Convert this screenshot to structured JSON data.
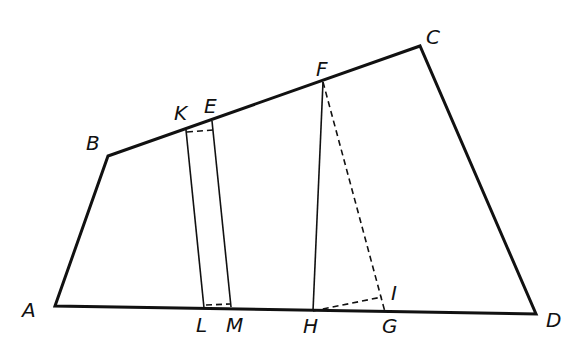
{
  "figure": {
    "colors": {
      "stroke": "#111111",
      "background": "#ffffff"
    },
    "points": {
      "A": {
        "x": 55,
        "y": 306
      },
      "B": {
        "x": 108,
        "y": 156
      },
      "C": {
        "x": 420,
        "y": 46
      },
      "D": {
        "x": 536,
        "y": 314
      },
      "K": {
        "x": 186,
        "y": 130
      },
      "E": {
        "x": 212,
        "y": 121
      },
      "L": {
        "x": 204,
        "y": 308
      },
      "M": {
        "x": 231,
        "y": 307
      },
      "F": {
        "x": 323,
        "y": 82
      },
      "H": {
        "x": 313,
        "y": 311
      },
      "G": {
        "x": 385,
        "y": 312
      },
      "I": {
        "x": 382,
        "y": 297
      }
    },
    "labels": [
      {
        "id": "A",
        "text": "A",
        "x": 22,
        "y": 300
      },
      {
        "id": "B",
        "text": "B",
        "x": 86,
        "y": 133
      },
      {
        "id": "C",
        "text": "C",
        "x": 426,
        "y": 27
      },
      {
        "id": "D",
        "text": "D",
        "x": 546,
        "y": 310
      },
      {
        "id": "K",
        "text": "K",
        "x": 174,
        "y": 103
      },
      {
        "id": "E",
        "text": "E",
        "x": 204,
        "y": 96
      },
      {
        "id": "F",
        "text": "F",
        "x": 316,
        "y": 59
      },
      {
        "id": "L",
        "text": "L",
        "x": 196,
        "y": 315
      },
      {
        "id": "M",
        "text": "M",
        "x": 226,
        "y": 315
      },
      {
        "id": "H",
        "text": "H",
        "x": 303,
        "y": 316
      },
      {
        "id": "G",
        "text": "G",
        "x": 382,
        "y": 316
      },
      {
        "id": "I",
        "text": "I",
        "x": 391,
        "y": 283
      }
    ],
    "segments": [
      {
        "from": "A",
        "to": "B",
        "style": "bold"
      },
      {
        "from": "B",
        "to": "C",
        "style": "bold"
      },
      {
        "from": "C",
        "to": "D",
        "style": "bold"
      },
      {
        "from": "D",
        "to": "A",
        "style": "bold"
      },
      {
        "from": "K",
        "to": "L",
        "style": "thin"
      },
      {
        "from": "E",
        "to": "M",
        "style": "thin"
      },
      {
        "from": "F",
        "to": "H",
        "style": "thin"
      },
      {
        "from": "K",
        "to": "E",
        "style": "dashed",
        "note": "small dashed segment near top of strip"
      },
      {
        "from": "L",
        "to": "M",
        "style": "dashed",
        "note": "small dashed segment near base of strip"
      },
      {
        "from": "F",
        "to": "G",
        "style": "dashed"
      },
      {
        "from": "H",
        "to": "I",
        "style": "dashed"
      }
    ]
  }
}
